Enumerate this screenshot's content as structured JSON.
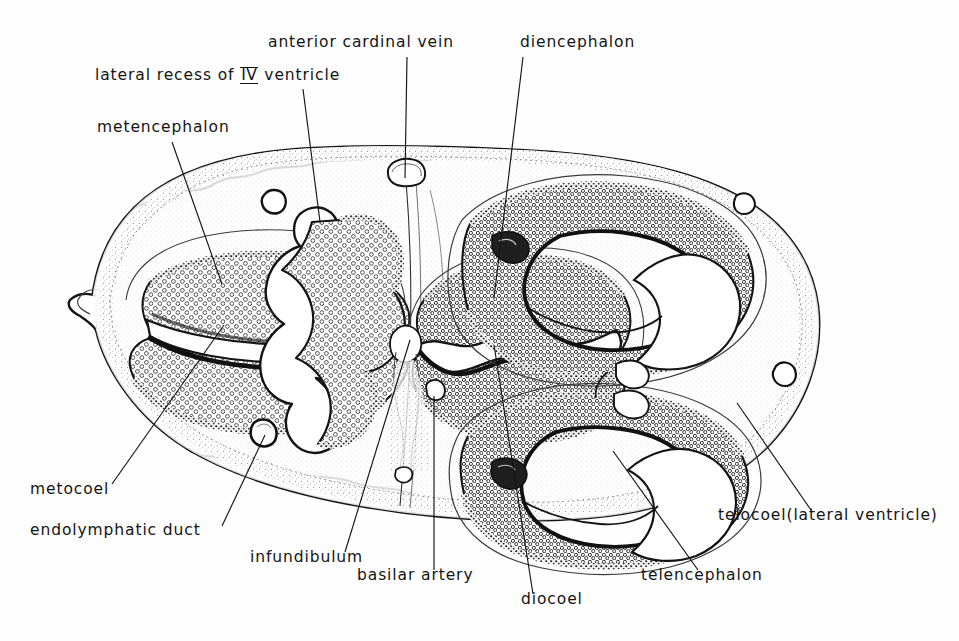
{
  "figure": {
    "ink_color": "#141414",
    "background_color": "#fefefe",
    "stipple_color": "#2a2a2a"
  },
  "labels": [
    {
      "id": "anterior-cardinal-vein",
      "text": "anterior cardinal vein",
      "x": 268,
      "y": 48,
      "leader": {
        "x1": 407,
        "y1": 57,
        "x2": 405,
        "y2": 178
      }
    },
    {
      "id": "diencephalon",
      "text": "diencephalon",
      "x": 520,
      "y": 48,
      "leader": {
        "x1": 523,
        "y1": 57,
        "x2": 494,
        "y2": 298
      }
    },
    {
      "id": "lateral-recess-of-iv-ventricle",
      "pre": "lateral recess of ",
      "numeral": "IV",
      "post": " ventricle",
      "text": "lateral recess of IV ventricle",
      "x": 95,
      "y": 80,
      "leader": {
        "x1": 303,
        "y1": 89,
        "x2": 320,
        "y2": 222
      }
    },
    {
      "id": "metencephalon",
      "text": "metencephalon",
      "x": 97,
      "y": 133,
      "leader": {
        "x1": 172,
        "y1": 142,
        "x2": 222,
        "y2": 284
      }
    },
    {
      "id": "metocoel",
      "text": "metocoel",
      "x": 30,
      "y": 495,
      "leader": {
        "x1": 112,
        "y1": 484,
        "x2": 224,
        "y2": 325
      }
    },
    {
      "id": "endolymphatic-duct",
      "text": "endolymphatic duct",
      "x": 30,
      "y": 536,
      "leader": {
        "x1": 222,
        "y1": 526,
        "x2": 265,
        "y2": 435
      }
    },
    {
      "id": "infundibulum",
      "text": "infundibulum",
      "x": 250,
      "y": 563,
      "leader": {
        "x1": 345,
        "y1": 552,
        "x2": 410,
        "y2": 340
      }
    },
    {
      "id": "basilar-artery",
      "text": "basilar artery",
      "x": 357,
      "y": 581,
      "leader": {
        "x1": 434,
        "y1": 570,
        "x2": 434,
        "y2": 396
      }
    },
    {
      "id": "diocoel",
      "text": "diocoel",
      "x": 521,
      "y": 605,
      "leader": {
        "x1": 533,
        "y1": 594,
        "x2": 494,
        "y2": 345
      }
    },
    {
      "id": "telencephalon",
      "text": "telencephalon",
      "x": 641,
      "y": 581,
      "leader": {
        "x1": 698,
        "y1": 570,
        "x2": 613,
        "y2": 451
      }
    },
    {
      "id": "telocoel-lateral-ventricle",
      "text": "telocoel(lateral ventricle)",
      "x": 718,
      "y": 521,
      "leader": {
        "x1": 811,
        "y1": 510,
        "x2": 737,
        "y2": 403
      }
    }
  ],
  "chart_data": {
    "type": "diagram",
    "regions": [
      {
        "name": "metencephalon",
        "side": "left",
        "tissue": "stippled neural epithelium"
      },
      {
        "name": "metocoel",
        "side": "left",
        "tissue": "ventricular cavity (slit)"
      },
      {
        "name": "lateral recess of IV ventricle",
        "side": "left-center",
        "tissue": "cavity"
      },
      {
        "name": "endolymphatic duct",
        "side": "left-ventral",
        "tissue": "small duct lumen"
      },
      {
        "name": "anterior cardinal vein",
        "side": "dorsal-midline",
        "tissue": "vessel lumen"
      },
      {
        "name": "diencephalon",
        "side": "center",
        "tissue": "stippled neural epithelium"
      },
      {
        "name": "diocoel",
        "side": "center",
        "tissue": "third ventricle cavity"
      },
      {
        "name": "infundibulum",
        "side": "ventral-center",
        "tissue": "evagination"
      },
      {
        "name": "basilar artery",
        "side": "ventral-midline",
        "tissue": "vessel lumen"
      },
      {
        "name": "telencephalon",
        "side": "right",
        "tissue": "stippled neural epithelium"
      },
      {
        "name": "telocoel (lateral ventricle)",
        "side": "right",
        "tissue": "ventricular cavity"
      }
    ]
  }
}
